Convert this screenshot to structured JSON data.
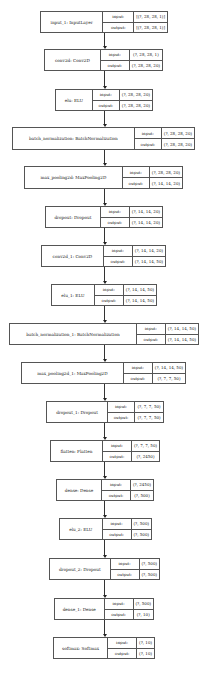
{
  "diagram": {
    "type": "keras-model-plot",
    "port_labels": {
      "input": "input:",
      "output": "output:"
    },
    "nodes": [
      {
        "name": "input_1: InputLayer",
        "input": "[(?, 28, 28, 1)]",
        "output": "[(?, 28, 28, 1)]"
      },
      {
        "name": "conv2d: Conv2D",
        "input": "(?, 28, 28, 1)",
        "output": "(?, 28, 28, 20)"
      },
      {
        "name": "elu: ELU",
        "input": "(?, 28, 28, 20)",
        "output": "(?, 28, 28, 20)"
      },
      {
        "name": "batch_normalization: BatchNormalization",
        "input": "(?, 28, 28, 20)",
        "output": "(?, 28, 28, 20)"
      },
      {
        "name": "max_pooling2d: MaxPooling2D",
        "input": "(?, 28, 28, 20)",
        "output": "(?, 14, 14, 20)"
      },
      {
        "name": "dropout: Dropout",
        "input": "(?, 14, 14, 20)",
        "output": "(?, 14, 14, 20)"
      },
      {
        "name": "conv2d_1: Conv2D",
        "input": "(?, 14, 14, 20)",
        "output": "(?, 14, 14, 50)"
      },
      {
        "name": "elu_1: ELU",
        "input": "(?, 14, 14, 50)",
        "output": "(?, 14, 14, 50)"
      },
      {
        "name": "batch_normalization_1: BatchNormalization",
        "input": "(?, 14, 14, 50)",
        "output": "(?, 14, 14, 50)"
      },
      {
        "name": "max_pooling2d_1: MaxPooling2D",
        "input": "(?, 14, 14, 50)",
        "output": "(?, 7, 7, 50)"
      },
      {
        "name": "dropout_1: Dropout",
        "input": "(?, 7, 7, 50)",
        "output": "(?, 7, 7, 50)"
      },
      {
        "name": "flatten: Flatten",
        "input": "(?, 7, 7, 50)",
        "output": "(?, 2450)"
      },
      {
        "name": "dense: Dense",
        "input": "(?, 2450)",
        "output": "(?, 500)"
      },
      {
        "name": "elu_2: ELU",
        "input": "(?, 500)",
        "output": "(?, 500)"
      },
      {
        "name": "dropout_2: Dropout",
        "input": "(?, 500)",
        "output": "(?, 500)"
      },
      {
        "name": "dense_1: Dense",
        "input": "(?, 500)",
        "output": "(?, 10)"
      },
      {
        "name": "softmax: Softmax",
        "input": "(?, 10)",
        "output": "(?, 10)"
      }
    ]
  }
}
